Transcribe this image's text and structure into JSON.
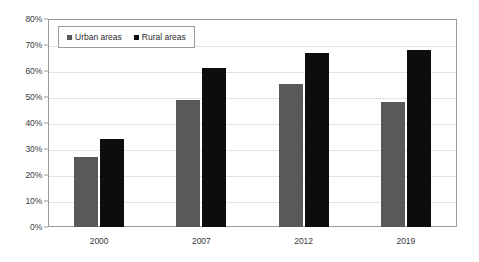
{
  "chart_data": {
    "type": "bar",
    "title": "",
    "xlabel": "",
    "ylabel": "",
    "categories": [
      "2000",
      "2007",
      "2012",
      "2019"
    ],
    "series": [
      {
        "name": "Urban areas",
        "color": "#595959",
        "values": [
          27,
          34.5,
          55,
          48
        ]
      },
      {
        "name": "Rural areas",
        "color": "#0d0d0d",
        "values": [
          34,
          61,
          67,
          68
        ]
      }
    ],
    "ylim": [
      0,
      80
    ],
    "ytick_step": 10,
    "ytick_labels": [
      "80%",
      "70%",
      "60%",
      "50%",
      "40%",
      "30%",
      "20%",
      "10%",
      "0%"
    ],
    "ytick_values": [
      80,
      70,
      60,
      50,
      40,
      30,
      20,
      10,
      0
    ],
    "grid": true,
    "grid_axis": "y",
    "legend": {
      "position": "top-left-inside",
      "bordered": true,
      "entries": [
        {
          "label": "Urban areas",
          "marker": "square",
          "color": "#595959"
        },
        {
          "label": "Rural areas",
          "marker": "square",
          "color": "#0d0d0d"
        }
      ]
    },
    "value_labels": false,
    "plot_border": true,
    "background": "#ffffff"
  },
  "corrected_series": [
    {
      "name": "Urban areas",
      "values": [
        27,
        49,
        55,
        48
      ]
    },
    {
      "name": "Rural areas",
      "values": [
        34,
        61,
        67,
        68
      ]
    }
  ]
}
